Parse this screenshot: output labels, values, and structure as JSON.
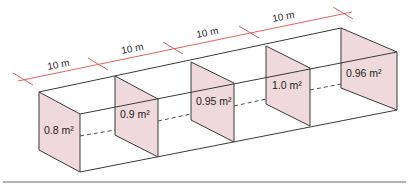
{
  "diagram": {
    "type": "isometric-segmented-channel",
    "colors": {
      "panel_fill": "#f0d9dc",
      "edge": "#3a3a3a",
      "dimension": "#d9534f"
    },
    "dimensions": [
      {
        "label": "10 m"
      },
      {
        "label": "10 m"
      },
      {
        "label": "10 m"
      },
      {
        "label": "10 m"
      }
    ],
    "cross_sections": [
      {
        "label": "0.8 m²"
      },
      {
        "label": "0.9 m²"
      },
      {
        "label": "0.95 m²"
      },
      {
        "label": "1.0 m²"
      },
      {
        "label": "0.96 m²"
      }
    ]
  }
}
